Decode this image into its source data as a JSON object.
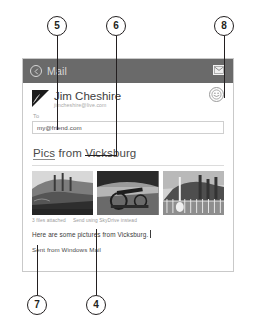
{
  "figure": {
    "callouts": [
      {
        "number": "5"
      },
      {
        "number": "6"
      },
      {
        "number": "8"
      },
      {
        "number": "7"
      },
      {
        "number": "4"
      }
    ]
  },
  "app": {
    "title": "Mail",
    "back_icon": "back-arrow-icon",
    "send_icon": "send-envelope-icon",
    "more_icon": "more-options-icon"
  },
  "compose": {
    "from": {
      "name": "Jim Cheshire",
      "email": "jimcheshire@live.com",
      "avatar_icon": "contact-avatar-icon"
    },
    "to": {
      "label": "To",
      "value": "my@friend.com",
      "placeholder": "To"
    },
    "subject": {
      "misspelled_word": "Pics",
      "rest": " from Vicksburg"
    },
    "attachments": {
      "count_label": "3 files attached",
      "skydrive_label": "Send using SkyDrive instead",
      "thumbs": [
        {
          "alt": "ironclad-gunboat-photo"
        },
        {
          "alt": "civil-war-cannon-photo"
        },
        {
          "alt": "monument-fence-photo"
        }
      ]
    },
    "body": "Here are some pictures from Vicksburg.",
    "signature": "Sent from Windows Mail"
  },
  "colors": {
    "title_bar": "#6a6a6a",
    "ink": "#231f20",
    "field_border": "#cfcfcf"
  }
}
